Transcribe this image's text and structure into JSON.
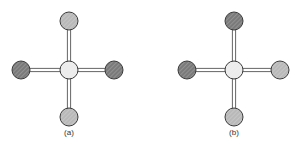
{
  "figure": {
    "panels": [
      {
        "label": "(a)",
        "center": {
          "x": 69,
          "y": 70,
          "shade": "light"
        },
        "ligands": [
          {
            "position": "top",
            "x": 69,
            "y": 21,
            "shade": "medium"
          },
          {
            "position": "left",
            "x": 21,
            "y": 70,
            "shade": "dark"
          },
          {
            "position": "right",
            "x": 114,
            "y": 70,
            "shade": "dark"
          },
          {
            "position": "bottom",
            "x": 69,
            "y": 117,
            "shade": "medium"
          }
        ]
      },
      {
        "label": "(b)",
        "center": {
          "x": 234,
          "y": 70,
          "shade": "light"
        },
        "ligands": [
          {
            "position": "top",
            "x": 234,
            "y": 21,
            "shade": "dark"
          },
          {
            "position": "left",
            "x": 187,
            "y": 70,
            "shade": "dark"
          },
          {
            "position": "right",
            "x": 280,
            "y": 70,
            "shade": "medium"
          },
          {
            "position": "bottom",
            "x": 234,
            "y": 117,
            "shade": "medium"
          }
        ]
      }
    ],
    "colors": {
      "light": "#ececec",
      "medium": "#b9b9b9",
      "dark": "#7a7a7a",
      "outline": "#3a3a3a",
      "bond": "#555555"
    }
  }
}
